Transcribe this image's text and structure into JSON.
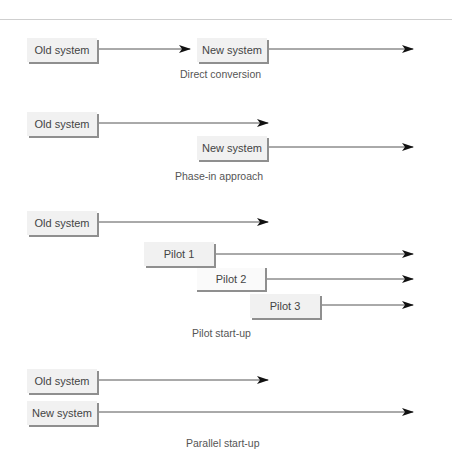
{
  "diagrams": [
    {
      "caption": "Direct conversion",
      "boxes": [
        {
          "label": "Old system"
        },
        {
          "label": "New system"
        }
      ]
    },
    {
      "caption": "Phase-in approach",
      "boxes": [
        {
          "label": "Old system"
        },
        {
          "label": "New system"
        }
      ]
    },
    {
      "caption": "Pilot start-up",
      "boxes": [
        {
          "label": "Old system"
        },
        {
          "label": "Pilot 1"
        },
        {
          "label": "Pilot 2"
        },
        {
          "label": "Pilot 3"
        }
      ]
    },
    {
      "caption": "Parallel start-up",
      "boxes": [
        {
          "label": "Old system"
        },
        {
          "label": "New system"
        }
      ]
    }
  ],
  "colors": {
    "box_fill": "#f1f1f1",
    "box_shadow": "#8f8f8f",
    "line": "#555555",
    "arrowhead": "#111111",
    "text": "#444444"
  }
}
